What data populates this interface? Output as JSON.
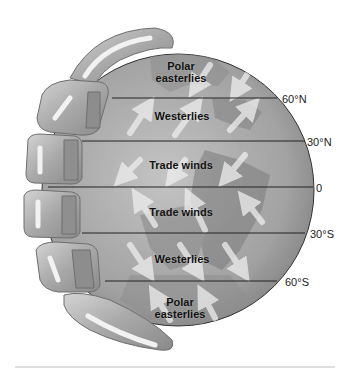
{
  "diagram": {
    "colors": {
      "background": "#ffffff",
      "globe_light": "#b9b9b9",
      "globe_dark": "#7d7d7d",
      "land": "#8a8a8a",
      "cell": "#a9a9a9",
      "arrow": "#eeeeee",
      "latitude_line": "#222222",
      "text": "#111111"
    },
    "wind_belts": [
      {
        "id": "polar-easterlies-north",
        "label_line1": "Polar",
        "label_line2": "easterlies"
      },
      {
        "id": "westerlies-north",
        "label": "Westerlies"
      },
      {
        "id": "trade-winds-north",
        "label": "Trade winds"
      },
      {
        "id": "trade-winds-south",
        "label": "Trade winds"
      },
      {
        "id": "westerlies-south",
        "label": "Westerlies"
      },
      {
        "id": "polar-easterlies-south",
        "label_line1": "Polar",
        "label_line2": "easterlies"
      }
    ],
    "latitudes": [
      {
        "label": "60°N",
        "y": 98
      },
      {
        "label": "30°N",
        "y": 141
      },
      {
        "label": "0",
        "y": 187
      },
      {
        "label": "30°S",
        "y": 233
      },
      {
        "label": "60°S",
        "y": 281
      }
    ]
  }
}
